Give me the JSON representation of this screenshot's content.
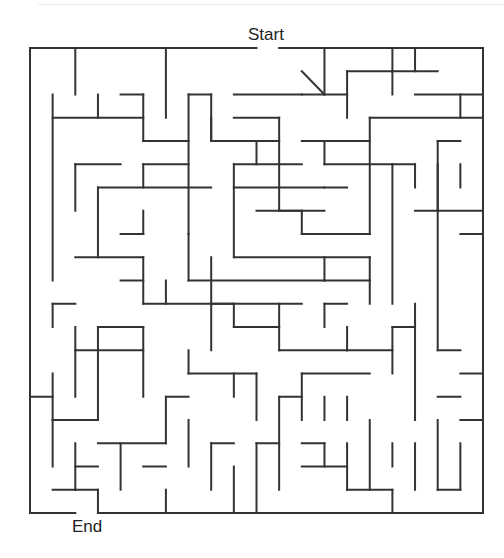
{
  "maze": {
    "start_label": "Start",
    "end_label": "End",
    "wall_color": "#333333",
    "grid": {
      "cols": 20,
      "rows": 20,
      "x0": 30,
      "y0": 48,
      "cell_w": 22.65,
      "cell_h": 23.25
    },
    "walls": [
      [
        0,
        0,
        10,
        0
      ],
      [
        11,
        0,
        20,
        0
      ],
      [
        0,
        0,
        0,
        20
      ],
      [
        20,
        0,
        20,
        20
      ],
      [
        0,
        20,
        2,
        20
      ],
      [
        3,
        20,
        20,
        20
      ],
      [
        2,
        0,
        2,
        2
      ],
      [
        1,
        2,
        1,
        10
      ],
      [
        3,
        2,
        3,
        3
      ],
      [
        1,
        3,
        5,
        3
      ],
      [
        4,
        2,
        5,
        2
      ],
      [
        5,
        2,
        5,
        4
      ],
      [
        5,
        4,
        7,
        4
      ],
      [
        6,
        0,
        6,
        3
      ],
      [
        7,
        2,
        8,
        2
      ],
      [
        7,
        2,
        7,
        8
      ],
      [
        8,
        2,
        8,
        4
      ],
      [
        8,
        4,
        11,
        4
      ],
      [
        8,
        3,
        8,
        4
      ],
      [
        2,
        5,
        4,
        5
      ],
      [
        2,
        5,
        2,
        7
      ],
      [
        5,
        5,
        7,
        5
      ],
      [
        5,
        5,
        5,
        6
      ],
      [
        3,
        6,
        8,
        6
      ],
      [
        3,
        6,
        3,
        9
      ],
      [
        4,
        8,
        5,
        8
      ],
      [
        5,
        7,
        5,
        8
      ],
      [
        9,
        2,
        12,
        2
      ],
      [
        9,
        3,
        11,
        3
      ],
      [
        11,
        3,
        11,
        7
      ],
      [
        11,
        7,
        12,
        7
      ],
      [
        10,
        4,
        10,
        5
      ],
      [
        13,
        0,
        13,
        2
      ],
      [
        12,
        1,
        13,
        2
      ],
      [
        12,
        2,
        14,
        2
      ],
      [
        14,
        1,
        14,
        3
      ],
      [
        14,
        1,
        16,
        1
      ],
      [
        15,
        3,
        20,
        3
      ],
      [
        15,
        3,
        15,
        8
      ],
      [
        16,
        0,
        16,
        2
      ],
      [
        17,
        2,
        20,
        2
      ],
      [
        16,
        1,
        18,
        1
      ],
      [
        17,
        0,
        17,
        1
      ],
      [
        9,
        5,
        12,
        5
      ],
      [
        9,
        5,
        9,
        9
      ],
      [
        9,
        6,
        13,
        6
      ],
      [
        9,
        9,
        15,
        9
      ],
      [
        10,
        7,
        13,
        7
      ],
      [
        12,
        7,
        12,
        8
      ],
      [
        12,
        4,
        15,
        4
      ],
      [
        13,
        5,
        16,
        5
      ],
      [
        13,
        6,
        14,
        6
      ],
      [
        12,
        8,
        15,
        8
      ],
      [
        16,
        5,
        17,
        5
      ],
      [
        16,
        5,
        16,
        11
      ],
      [
        17,
        5,
        17,
        6
      ],
      [
        18,
        5,
        18,
        7
      ],
      [
        17,
        7,
        20,
        7
      ],
      [
        13,
        4,
        13,
        5
      ],
      [
        13,
        9,
        13,
        10
      ],
      [
        13,
        10,
        15,
        10
      ],
      [
        15,
        9,
        15,
        10
      ],
      [
        15,
        10,
        15,
        11
      ],
      [
        19,
        2,
        19,
        3
      ],
      [
        18,
        4,
        19,
        4
      ],
      [
        18,
        4,
        18,
        13
      ],
      [
        19,
        5,
        19,
        6
      ],
      [
        19,
        8,
        20,
        8
      ],
      [
        2,
        9,
        5,
        9
      ],
      [
        5,
        9,
        5,
        11
      ],
      [
        4,
        10,
        5,
        10
      ],
      [
        8,
        9,
        8,
        13
      ],
      [
        7,
        10,
        13,
        10
      ],
      [
        8,
        11,
        12,
        11
      ],
      [
        7,
        8,
        7,
        10
      ],
      [
        1,
        11,
        2,
        11
      ],
      [
        1,
        11,
        1,
        12
      ],
      [
        2,
        12,
        2,
        13
      ],
      [
        2,
        13,
        5,
        13
      ],
      [
        5,
        12,
        5,
        15
      ],
      [
        3,
        12,
        5,
        12
      ],
      [
        5,
        11,
        9,
        11
      ],
      [
        6,
        10,
        6,
        11
      ],
      [
        9,
        11,
        9,
        12
      ],
      [
        9,
        12,
        11,
        12
      ],
      [
        11,
        11,
        11,
        13
      ],
      [
        13,
        11,
        14,
        11
      ],
      [
        13,
        11,
        13,
        12
      ],
      [
        14,
        12,
        14,
        13
      ],
      [
        14,
        13,
        16,
        13
      ],
      [
        16,
        12,
        16,
        14
      ],
      [
        1,
        14,
        1,
        16
      ],
      [
        0,
        15,
        1,
        15
      ],
      [
        2,
        13,
        2,
        15
      ],
      [
        3,
        12,
        3,
        16
      ],
      [
        1,
        16,
        3,
        16
      ],
      [
        1,
        16,
        1,
        18
      ],
      [
        7,
        13,
        7,
        14
      ],
      [
        7,
        14,
        10,
        14
      ],
      [
        6,
        15,
        7,
        15
      ],
      [
        6,
        15,
        6,
        17
      ],
      [
        9,
        14,
        9,
        15
      ],
      [
        10,
        14,
        10,
        16
      ],
      [
        11,
        13,
        14,
        13
      ],
      [
        12,
        14,
        12,
        16
      ],
      [
        12,
        14,
        15,
        14
      ],
      [
        13,
        15,
        13,
        16
      ],
      [
        14,
        15,
        14,
        16
      ],
      [
        17,
        11,
        17,
        16
      ],
      [
        16,
        12,
        17,
        12
      ],
      [
        18,
        13,
        19,
        13
      ],
      [
        19,
        14,
        20,
        14
      ],
      [
        18,
        15,
        19,
        15
      ],
      [
        3,
        17,
        6,
        17
      ],
      [
        2,
        18,
        3,
        18
      ],
      [
        2,
        17,
        2,
        19
      ],
      [
        4,
        17,
        4,
        19
      ],
      [
        5,
        18,
        6,
        18
      ],
      [
        6,
        19,
        6,
        20
      ],
      [
        1,
        19,
        2,
        19
      ],
      [
        3,
        19,
        3,
        20
      ],
      [
        2,
        19,
        3,
        19
      ],
      [
        8,
        17,
        9,
        17
      ],
      [
        8,
        17,
        8,
        19
      ],
      [
        10,
        17,
        11,
        17
      ],
      [
        10,
        17,
        10,
        20
      ],
      [
        9,
        18,
        9,
        20
      ],
      [
        7,
        16,
        7,
        18
      ],
      [
        11,
        15,
        12,
        15
      ],
      [
        11,
        15,
        11,
        19
      ],
      [
        12,
        17,
        13,
        17
      ],
      [
        13,
        17,
        13,
        18
      ],
      [
        12,
        18,
        14,
        18
      ],
      [
        14,
        17,
        14,
        19
      ],
      [
        14,
        19,
        16,
        19
      ],
      [
        16,
        17,
        16,
        18
      ],
      [
        15,
        16,
        15,
        19
      ],
      [
        17,
        17,
        17,
        19
      ],
      [
        18,
        16,
        18,
        19
      ],
      [
        16,
        20,
        16,
        19
      ],
      [
        19,
        16,
        20,
        16
      ],
      [
        19,
        17,
        19,
        19
      ],
      [
        18,
        19,
        19,
        19
      ]
    ]
  }
}
